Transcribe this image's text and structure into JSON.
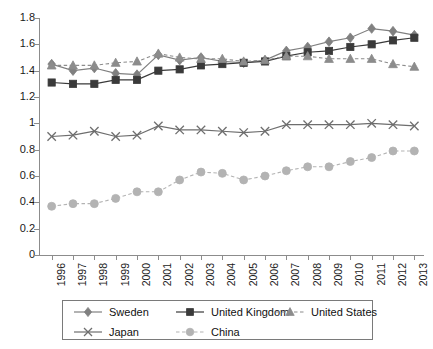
{
  "chart_data": {
    "type": "line",
    "title": "",
    "subtitle": "",
    "xlabel": "",
    "ylabel": "",
    "x": [
      1996,
      1997,
      1998,
      1999,
      2000,
      2001,
      2002,
      2003,
      2004,
      2005,
      2006,
      2007,
      2008,
      2009,
      2010,
      2011,
      2012,
      2013
    ],
    "categories": [
      "1996",
      "1997",
      "1998",
      "1999",
      "2000",
      "2001",
      "2002",
      "2003",
      "2004",
      "2005",
      "2006",
      "2007",
      "2008",
      "2009",
      "2010",
      "2011",
      "2012",
      "2013"
    ],
    "ylim": [
      0,
      1.8
    ],
    "yticks": [
      "0",
      "0.2",
      "0.4",
      "0.6",
      "0.8",
      "1",
      "1.2",
      "1.4",
      "1.6",
      "1.8"
    ],
    "ytick_values": [
      0,
      0.2,
      0.4,
      0.6,
      0.8,
      1.0,
      1.2,
      1.4,
      1.6,
      1.8
    ],
    "grid": false,
    "legend_position": "bottom",
    "series": [
      {
        "name": "Sweden",
        "marker": "diamond",
        "linestyle": "solid",
        "color": "#808080",
        "values": [
          1.45,
          1.4,
          1.42,
          1.38,
          1.37,
          1.52,
          1.48,
          1.5,
          1.47,
          1.46,
          1.48,
          1.55,
          1.58,
          1.62,
          1.65,
          1.72,
          1.7,
          1.67
        ]
      },
      {
        "name": "United Kingdom",
        "marker": "square",
        "linestyle": "solid",
        "color": "#3a3a3a",
        "values": [
          1.31,
          1.3,
          1.3,
          1.33,
          1.33,
          1.4,
          1.41,
          1.44,
          1.45,
          1.46,
          1.47,
          1.51,
          1.54,
          1.55,
          1.58,
          1.6,
          1.63,
          1.65
        ]
      },
      {
        "name": "United States",
        "marker": "triangle",
        "linestyle": "dashed",
        "color": "#8c8c8c",
        "values": [
          1.44,
          1.44,
          1.44,
          1.46,
          1.47,
          1.53,
          1.5,
          1.49,
          1.49,
          1.47,
          1.48,
          1.51,
          1.51,
          1.49,
          1.49,
          1.49,
          1.45,
          1.43
        ]
      },
      {
        "name": "Japan",
        "marker": "cross",
        "linestyle": "solid",
        "color": "#6e6e6e",
        "values": [
          0.9,
          0.91,
          0.94,
          0.9,
          0.91,
          0.98,
          0.95,
          0.95,
          0.94,
          0.93,
          0.94,
          0.99,
          0.99,
          0.99,
          0.99,
          1.0,
          0.99,
          0.98
        ]
      },
      {
        "name": "China",
        "marker": "circle",
        "linestyle": "dashed",
        "color": "#b3b3b3",
        "values": [
          0.37,
          0.39,
          0.39,
          0.43,
          0.48,
          0.48,
          0.57,
          0.63,
          0.62,
          0.57,
          0.6,
          0.64,
          0.67,
          0.67,
          0.71,
          0.74,
          0.79,
          0.79
        ]
      }
    ]
  },
  "legend": {
    "rows": [
      [
        {
          "label": "Sweden",
          "series_index": 0
        },
        {
          "label": "United Kingdom",
          "series_index": 1
        },
        {
          "label": "United States",
          "series_index": 2
        }
      ],
      [
        {
          "label": "Japan",
          "series_index": 3
        },
        {
          "label": "China",
          "series_index": 4
        }
      ]
    ]
  },
  "colors": {
    "axis": "#8c8c8c",
    "background": "#ffffff",
    "text": "#1a1a1a",
    "legend_border": "#7a7a7a"
  }
}
